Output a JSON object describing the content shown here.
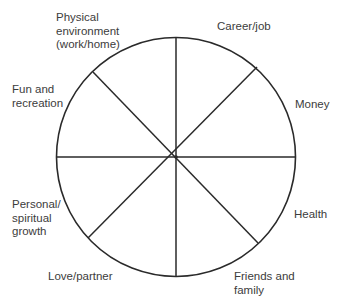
{
  "diagram": {
    "type": "wheel-of-life",
    "center": [
      176,
      157
    ],
    "radius": 119,
    "stroke_color": "#2a2a2a",
    "text_color": "#3c3c3c",
    "spokes": [
      {
        "name": "spoke-vertical",
        "x1": 176,
        "y1": 38,
        "x2": 176,
        "y2": 277
      },
      {
        "name": "spoke-horizontal",
        "x1": 57,
        "y1": 157,
        "x2": 295,
        "y2": 157
      },
      {
        "name": "spoke-diagonal-ul-lr",
        "x1": 93,
        "y1": 72,
        "x2": 258,
        "y2": 243
      },
      {
        "name": "spoke-diagonal-ur-ll",
        "x1": 257,
        "y1": 67,
        "x2": 88,
        "y2": 238
      }
    ],
    "segments": [
      {
        "id": "career",
        "lines": [
          "Career/job"
        ]
      },
      {
        "id": "money",
        "lines": [
          "Money"
        ]
      },
      {
        "id": "health",
        "lines": [
          "Health"
        ]
      },
      {
        "id": "friends",
        "lines": [
          "Friends and",
          "family"
        ]
      },
      {
        "id": "love",
        "lines": [
          "Love/partner"
        ]
      },
      {
        "id": "personal",
        "lines": [
          "Personal/",
          "spiritual",
          "growth"
        ]
      },
      {
        "id": "fun",
        "lines": [
          "Fun and",
          "recreation"
        ]
      },
      {
        "id": "physical",
        "lines": [
          "Physical",
          "environment",
          "(work/home)"
        ]
      }
    ]
  }
}
